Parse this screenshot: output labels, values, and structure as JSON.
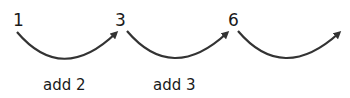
{
  "numbers": [
    "1",
    "3",
    "6"
  ],
  "steps": [
    {
      "label": "add 2"
    },
    {
      "label": "add 3"
    },
    {
      "label": ""
    }
  ],
  "colors": {
    "arc": "#333333",
    "text": "#1a1a1a"
  }
}
